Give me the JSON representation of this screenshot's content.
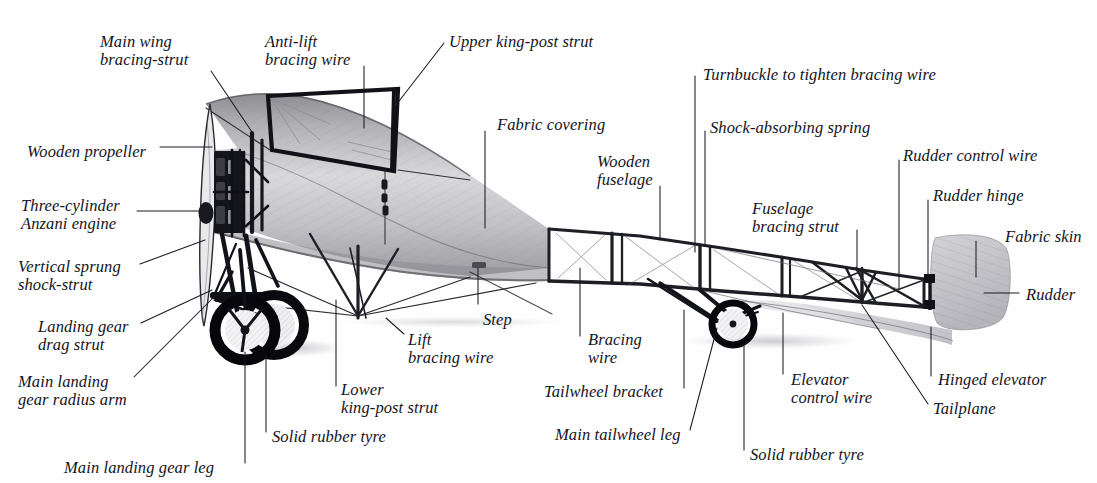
{
  "figure": {
    "kind": "annotated-technical-illustration",
    "background_color": "#fefefe",
    "label_text_color": "#14141c",
    "leader_line_color": "#1a1a22"
  },
  "labels": [
    {
      "id": "main-wing-bracing-strut",
      "text": "Main wing\nbracing-strut",
      "x": 100,
      "y": 33,
      "align": "left"
    },
    {
      "id": "anti-lift-bracing-wire",
      "text": "Anti-lift\nbracing wire",
      "x": 265,
      "y": 33,
      "align": "left"
    },
    {
      "id": "upper-king-post-strut",
      "text": "Upper king-post strut",
      "x": 449,
      "y": 33,
      "align": "left"
    },
    {
      "id": "turnbuckle-bracing-wire",
      "text": "Turnbuckle to tighten bracing wire",
      "x": 703,
      "y": 66,
      "align": "left"
    },
    {
      "id": "wooden-propeller",
      "text": "Wooden propeller",
      "x": 27,
      "y": 143,
      "align": "left"
    },
    {
      "id": "shock-absorbing-spring",
      "text": "Shock-absorbing spring",
      "x": 710,
      "y": 119,
      "align": "left"
    },
    {
      "id": "fabric-covering",
      "text": "Fabric covering",
      "x": 497,
      "y": 116,
      "align": "left"
    },
    {
      "id": "rudder-control-wire",
      "text": "Rudder control wire",
      "x": 903,
      "y": 147,
      "align": "left"
    },
    {
      "id": "wooden-fuselage",
      "text": "Wooden\nfuselage",
      "x": 597,
      "y": 153,
      "align": "left"
    },
    {
      "id": "rudder-hinge",
      "text": "Rudder hinge",
      "x": 933,
      "y": 187,
      "align": "left"
    },
    {
      "id": "three-cylinder-anzani",
      "text": "Three-cylinder\nAnzani engine",
      "x": 21,
      "y": 197,
      "align": "left"
    },
    {
      "id": "fuselage-bracing-strut",
      "text": "Fuselage\nbracing strut",
      "x": 752,
      "y": 200,
      "align": "left"
    },
    {
      "id": "fabric-skin",
      "text": "Fabric skin",
      "x": 1005,
      "y": 228,
      "align": "left"
    },
    {
      "id": "vertical-sprung-shock-strut",
      "text": "Vertical sprung\nshock-strut",
      "x": 18,
      "y": 258,
      "align": "left"
    },
    {
      "id": "rudder",
      "text": "Rudder",
      "x": 1026,
      "y": 286,
      "align": "left"
    },
    {
      "id": "landing-gear-drag-strut",
      "text": "Landing gear\ndrag strut",
      "x": 38,
      "y": 318,
      "align": "left"
    },
    {
      "id": "lift-bracing-wire",
      "text": "Lift\nbracing wire",
      "x": 408,
      "y": 331,
      "align": "left"
    },
    {
      "id": "step",
      "text": "Step",
      "x": 483,
      "y": 311,
      "align": "left"
    },
    {
      "id": "bracing-wire",
      "text": "Bracing\nwire",
      "x": 588,
      "y": 331,
      "align": "left"
    },
    {
      "id": "elevator-control-wire",
      "text": "Elevator\ncontrol wire",
      "x": 791,
      "y": 371,
      "align": "left"
    },
    {
      "id": "main-landing-gear-radius-arm",
      "text": "Main landing\ngear radius arm",
      "x": 18,
      "y": 373,
      "align": "left"
    },
    {
      "id": "hinged-elevator",
      "text": "Hinged elevator",
      "x": 938,
      "y": 371,
      "align": "left"
    },
    {
      "id": "lower-king-post-strut",
      "text": "Lower\nking-post strut",
      "x": 341,
      "y": 381,
      "align": "left"
    },
    {
      "id": "tailwheel-bracket",
      "text": "Tailwheel bracket",
      "x": 544,
      "y": 383,
      "align": "left"
    },
    {
      "id": "solid-rubber-tyre-front",
      "text": "Solid rubber tyre",
      "x": 272,
      "y": 428,
      "align": "left"
    },
    {
      "id": "tailplane",
      "text": "Tailplane",
      "x": 933,
      "y": 400,
      "align": "left"
    },
    {
      "id": "main-tailwheel-leg",
      "text": "Main tailwheel leg",
      "x": 555,
      "y": 426,
      "align": "left"
    },
    {
      "id": "solid-rubber-tyre-tail",
      "text": "Solid rubber tyre",
      "x": 750,
      "y": 446,
      "align": "left"
    },
    {
      "id": "main-landing-gear-leg",
      "text": "Main landing gear leg",
      "x": 64,
      "y": 459,
      "align": "left"
    }
  ],
  "leaders": [
    {
      "id": "leader-main-wing-bracing-strut",
      "points": "211,71 252,132"
    },
    {
      "id": "leader-anti-lift-bracing-wire",
      "points": "364,66 364,128"
    },
    {
      "id": "leader-upper-king-post-strut",
      "points": "444,43 396,105"
    },
    {
      "id": "leader-turnbuckle",
      "points": "695,76 695,252"
    },
    {
      "id": "leader-shock-absorbing-spring",
      "points": "705,131 705,245"
    },
    {
      "id": "leader-fabric-covering",
      "points": "485,131 485,228"
    },
    {
      "id": "leader-wooden-propeller",
      "points": "160,147 212,147"
    },
    {
      "id": "leader-rudder-control-wire",
      "points": "899,160 899,289"
    },
    {
      "id": "leader-wooden-fuselage",
      "points": "660,186 660,240"
    },
    {
      "id": "leader-rudder-hinge",
      "points": "928,200 928,277"
    },
    {
      "id": "leader-anzani-engine",
      "points": "137,211 212,211"
    },
    {
      "id": "leader-fuselage-bracing-strut",
      "points": "857,230 857,268"
    },
    {
      "id": "leader-fabric-skin",
      "points": "976,241 976,277"
    },
    {
      "id": "leader-vertical-sprung",
      "points": "140,264 205,240"
    },
    {
      "id": "leader-rudder",
      "points": "1019,293 984,293"
    },
    {
      "id": "leader-landing-gear-drag-strut",
      "points": "141,323 212,290"
    },
    {
      "id": "leader-lift-bracing-wire",
      "points": "404,334 386,318"
    },
    {
      "id": "leader-step",
      "points": "478,304 478,268"
    },
    {
      "id": "leader-bracing-wire",
      "points": "580,336 580,268"
    },
    {
      "id": "leader-elevator-control-wire",
      "points": "783,374 783,313"
    },
    {
      "id": "leader-main-lg-radius-arm",
      "points": "134,377 214,297"
    },
    {
      "id": "leader-hinged-elevator",
      "points": "931,376 931,327"
    },
    {
      "id": "leader-lower-king-post-strut",
      "points": "336,386 336,300"
    },
    {
      "id": "leader-tailwheel-bracket",
      "points": "684,388 684,310"
    },
    {
      "id": "leader-solid-rubber-tyre-front",
      "points": "266,432 266,355"
    },
    {
      "id": "leader-tailplane",
      "points": "928,404 862,305"
    },
    {
      "id": "leader-main-tailwheel-leg",
      "points": "690,430 717,328"
    },
    {
      "id": "leader-solid-rubber-tyre-tail",
      "points": "744,450 744,340"
    },
    {
      "id": "leader-main-landing-gear-leg",
      "points": "245,463 245,352"
    }
  ]
}
